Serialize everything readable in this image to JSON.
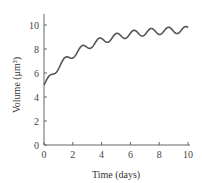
{
  "chart_data": {
    "type": "line",
    "title": "",
    "xlabel": "Time (days)",
    "ylabel": "Volume (μm³)",
    "xlim": [
      0,
      10
    ],
    "ylim": [
      0,
      10
    ],
    "xticks": [
      0,
      2,
      4,
      6,
      8,
      10
    ],
    "yticks": [
      0,
      2,
      4,
      6,
      8,
      10
    ],
    "grid": false,
    "series": [
      {
        "name": "Volume",
        "x": [
          0,
          0.5,
          1,
          1.5,
          2,
          2.5,
          3,
          3.5,
          4,
          4.5,
          5,
          5.5,
          6,
          6.5,
          7,
          7.5,
          8,
          8.5,
          9,
          9.5,
          10
        ],
        "values": [
          5.0,
          5.8,
          6.0,
          7.0,
          7.1,
          7.9,
          7.9,
          8.6,
          8.4,
          9.0,
          8.8,
          9.4,
          9.0,
          9.6,
          9.2,
          9.7,
          9.3,
          9.9,
          9.4,
          9.9,
          9.6
        ]
      }
    ],
    "color": "#555555"
  },
  "axes": {
    "x_label": "Time (days)",
    "y_label": "Volume (μm³)"
  }
}
